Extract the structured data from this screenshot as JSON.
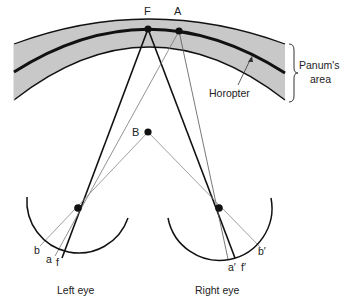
{
  "figure": {
    "points": {
      "F": "F",
      "A": "A",
      "B": "B"
    },
    "retina_labels": {
      "left": {
        "b": "b",
        "a": "a",
        "f": "f"
      },
      "right": {
        "a": "a′",
        "f": "f′",
        "b": "b′"
      }
    },
    "annotations": {
      "horopter": "Horopter",
      "panum_line1": "Panum's",
      "panum_line2": "area"
    },
    "eyes": {
      "left": "Left eye",
      "right": "Right eye"
    },
    "colors": {
      "band": "#c8c8c8",
      "line": "#111111",
      "thin_line": "#888888"
    }
  }
}
